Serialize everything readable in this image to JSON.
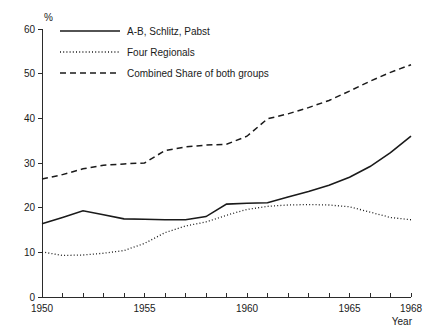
{
  "chart_data": {
    "type": "line",
    "title": "",
    "subtitle": "",
    "xlabel": "Year",
    "ylabel": "%",
    "xlim": [
      1950,
      1968
    ],
    "ylim": [
      0,
      60
    ],
    "grid": false,
    "legend_position": "top-left",
    "x": [
      1950,
      1951,
      1952,
      1953,
      1954,
      1955,
      1956,
      1957,
      1958,
      1959,
      1960,
      1961,
      1962,
      1963,
      1964,
      1965,
      1966,
      1967,
      1968
    ],
    "x_tick_values": [
      1950,
      1951,
      1952,
      1953,
      1954,
      1955,
      1956,
      1957,
      1958,
      1959,
      1960,
      1961,
      1962,
      1963,
      1964,
      1965,
      1966,
      1967,
      1968
    ],
    "x_tick_labels": [
      "1950",
      "",
      "",
      "",
      "",
      "1955",
      "",
      "",
      "",
      "",
      "1960",
      "",
      "",
      "",
      "",
      "1965",
      "",
      "",
      "1968"
    ],
    "y_tick_values": [
      0,
      10,
      20,
      30,
      40,
      50,
      60
    ],
    "y_tick_labels": [
      "0",
      "10",
      "20",
      "30",
      "40",
      "50",
      "60"
    ],
    "series": [
      {
        "name": "A-B, Schlitz, Pabst",
        "style": "solid",
        "color": "#1a1a1a",
        "values": [
          16.4,
          17.8,
          19.3,
          18.4,
          17.5,
          17.4,
          17.3,
          17.3,
          18.0,
          20.8,
          21.0,
          21.1,
          22.4,
          23.6,
          25.0,
          26.8,
          29.2,
          32.3,
          36.0
        ]
      },
      {
        "name": "Four Regionals",
        "style": "dotted",
        "color": "#1a1a1a",
        "values": [
          10.1,
          9.3,
          9.4,
          9.8,
          10.4,
          12.0,
          14.4,
          15.9,
          16.8,
          18.3,
          19.6,
          20.3,
          20.6,
          20.7,
          20.6,
          20.2,
          19.0,
          17.8,
          17.3
        ]
      },
      {
        "name": "Combined Share of both groups",
        "style": "dashed",
        "color": "#1a1a1a",
        "values": [
          26.4,
          27.4,
          28.7,
          29.5,
          29.8,
          30.0,
          32.8,
          33.6,
          34.0,
          34.2,
          36.0,
          39.9,
          41.0,
          42.4,
          44.0,
          46.1,
          48.3,
          50.3,
          52.0
        ]
      }
    ]
  },
  "legend": {
    "entries": [
      {
        "label": "A-B, Schlitz, Pabst",
        "style": "solid"
      },
      {
        "label": "Four Regionals",
        "style": "dotted"
      },
      {
        "label": "Combined Share of both groups",
        "style": "dashed"
      }
    ]
  }
}
